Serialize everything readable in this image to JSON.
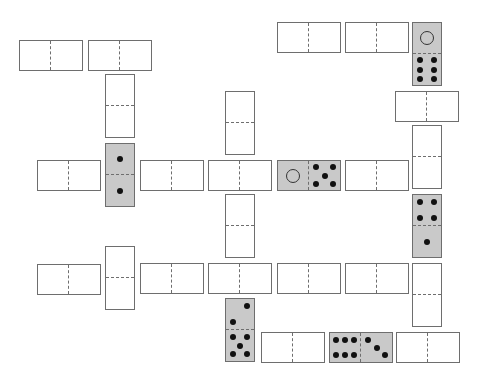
{
  "board": {
    "background": "#ffffff",
    "shaded_color": "#c9c9c9",
    "border_color": "#6e6e6e",
    "dominoes": [
      {
        "id": "d1",
        "orient": "h",
        "x": 19,
        "y": 40,
        "shaded": false,
        "a": null,
        "b": null
      },
      {
        "id": "d2",
        "orient": "h",
        "x": 88,
        "y": 40,
        "shaded": false,
        "a": null,
        "b": null
      },
      {
        "id": "d3",
        "orient": "h",
        "x": 277,
        "y": 22,
        "shaded": false,
        "a": null,
        "b": null
      },
      {
        "id": "d4",
        "orient": "h",
        "x": 345,
        "y": 22,
        "shaded": false,
        "a": null,
        "b": null
      },
      {
        "id": "d5",
        "orient": "v",
        "x": 412,
        "y": 22,
        "shaded": true,
        "a": 0,
        "b": 6
      },
      {
        "id": "d6",
        "orient": "h",
        "x": 395,
        "y": 91,
        "shaded": false,
        "a": null,
        "b": null
      },
      {
        "id": "d7",
        "orient": "v",
        "x": 105,
        "y": 74,
        "shaded": false,
        "a": null,
        "b": null
      },
      {
        "id": "d8",
        "orient": "v",
        "x": 225,
        "y": 91,
        "shaded": false,
        "a": null,
        "b": null
      },
      {
        "id": "d9",
        "orient": "v",
        "x": 412,
        "y": 125,
        "shaded": false,
        "a": null,
        "b": null
      },
      {
        "id": "d10",
        "orient": "h",
        "x": 37,
        "y": 160,
        "shaded": false,
        "a": null,
        "b": null
      },
      {
        "id": "d11",
        "orient": "v",
        "x": 105,
        "y": 143,
        "shaded": true,
        "a": 1,
        "b": 1
      },
      {
        "id": "d12",
        "orient": "h",
        "x": 140,
        "y": 160,
        "shaded": false,
        "a": null,
        "b": null
      },
      {
        "id": "d13",
        "orient": "h",
        "x": 208,
        "y": 160,
        "shaded": false,
        "a": null,
        "b": null
      },
      {
        "id": "d14",
        "orient": "h",
        "x": 277,
        "y": 160,
        "shaded": true,
        "a": 0,
        "b": 5
      },
      {
        "id": "d15",
        "orient": "h",
        "x": 345,
        "y": 160,
        "shaded": false,
        "a": null,
        "b": null
      },
      {
        "id": "d16",
        "orient": "v",
        "x": 225,
        "y": 194,
        "shaded": false,
        "a": null,
        "b": null
      },
      {
        "id": "d17",
        "orient": "v",
        "x": 412,
        "y": 194,
        "shaded": true,
        "a": 4,
        "b": 1
      },
      {
        "id": "d18",
        "orient": "v",
        "x": 105,
        "y": 246,
        "shaded": false,
        "a": null,
        "b": null
      },
      {
        "id": "d19",
        "orient": "h",
        "x": 37,
        "y": 264,
        "shaded": false,
        "a": null,
        "b": null
      },
      {
        "id": "d20",
        "orient": "h",
        "x": 140,
        "y": 263,
        "shaded": false,
        "a": null,
        "b": null
      },
      {
        "id": "d21",
        "orient": "h",
        "x": 208,
        "y": 263,
        "shaded": false,
        "a": null,
        "b": null
      },
      {
        "id": "d22",
        "orient": "h",
        "x": 277,
        "y": 263,
        "shaded": false,
        "a": null,
        "b": null
      },
      {
        "id": "d23",
        "orient": "h",
        "x": 345,
        "y": 263,
        "shaded": false,
        "a": null,
        "b": null
      },
      {
        "id": "d24",
        "orient": "v",
        "x": 412,
        "y": 263,
        "shaded": false,
        "a": null,
        "b": null
      },
      {
        "id": "d25",
        "orient": "v",
        "x": 225,
        "y": 298,
        "shaded": true,
        "a": 2,
        "b": 5
      },
      {
        "id": "d26",
        "orient": "h",
        "x": 261,
        "y": 332,
        "shaded": false,
        "a": null,
        "b": null
      },
      {
        "id": "d27",
        "orient": "h",
        "x": 329,
        "y": 332,
        "shaded": true,
        "a": 6,
        "b": 3
      },
      {
        "id": "d28",
        "orient": "h",
        "x": 396,
        "y": 332,
        "shaded": false,
        "a": null,
        "b": null
      }
    ]
  }
}
